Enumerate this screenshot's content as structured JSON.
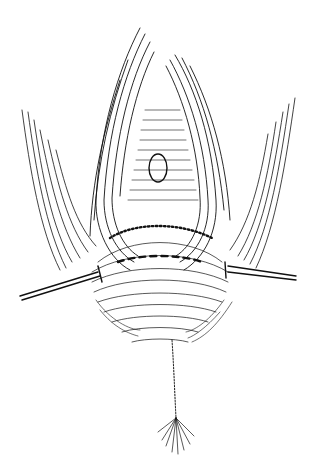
{
  "image": {
    "kind": "pen-and-ink medical illustration",
    "style": "black line hatching on white",
    "background": "#ffffff",
    "ink": "#111111",
    "elements": [
      "labia-folds",
      "retracted-tissue-field",
      "dashed-incision-line",
      "left-retractor-hook",
      "right-retractor-hook",
      "perineal-raphe-line",
      "anal-tuft"
    ]
  }
}
